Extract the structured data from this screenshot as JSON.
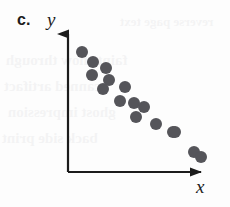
{
  "figure": {
    "part_label": "c.",
    "y_axis_label": "y",
    "x_axis_label": "x",
    "ink_color": "#1c1c1c",
    "dot_color": "#55555a",
    "background_color": "#fdfdfd"
  },
  "axes": {
    "origin": {
      "x": 68,
      "y": 172
    },
    "y_tip": {
      "x": 68,
      "y": 23
    },
    "x_tip": {
      "x": 212,
      "y": 172
    },
    "line_width": 2.2,
    "arrowhead": "solid-triangle"
  },
  "background_bleed": [
    {
      "text": "reverse page text",
      "x": 120,
      "y": 14,
      "size": 13
    },
    {
      "text": "faint show through",
      "x": 6,
      "y": 52,
      "size": 15
    },
    {
      "text": "scanned artifact",
      "x": 4,
      "y": 78,
      "size": 15
    },
    {
      "text": "ghost impression",
      "x": 8,
      "y": 104,
      "size": 15
    },
    {
      "text": "back side print",
      "x": 2,
      "y": 130,
      "size": 15
    }
  ],
  "chart_data": {
    "type": "scatter",
    "title": "c.",
    "xlabel": "x",
    "ylabel": "y",
    "grid": false,
    "legend": null,
    "axis_ticks": false,
    "xlim": [
      0,
      10
    ],
    "ylim": [
      0,
      10
    ],
    "relationship": "negative linear association",
    "series": [
      {
        "name": "observations",
        "marker": "filled-circle",
        "marker_color": "#55555a",
        "marker_size_px": 12,
        "points": [
          {
            "x": 0.55,
            "y": 8.85
          },
          {
            "x": 1.35,
            "y": 8.15
          },
          {
            "x": 1.25,
            "y": 7.25
          },
          {
            "x": 2.25,
            "y": 7.75
          },
          {
            "x": 2.45,
            "y": 6.95
          },
          {
            "x": 2.05,
            "y": 6.35
          },
          {
            "x": 3.55,
            "y": 6.45
          },
          {
            "x": 3.25,
            "y": 5.45
          },
          {
            "x": 4.25,
            "y": 5.35
          },
          {
            "x": 4.95,
            "y": 5.05
          },
          {
            "x": 4.35,
            "y": 4.35
          },
          {
            "x": 5.75,
            "y": 3.85
          },
          {
            "x": 6.95,
            "y": 3.35
          },
          {
            "x": 8.45,
            "y": 1.95
          },
          {
            "x": 8.95,
            "y": 1.55
          },
          {
            "x": 7.05,
            "y": 3.35
          }
        ]
      }
    ]
  },
  "pixel_points": [
    {
      "cx": 82,
      "cy": 52
    },
    {
      "cx": 93,
      "cy": 62
    },
    {
      "cx": 92,
      "cy": 75
    },
    {
      "cx": 106,
      "cy": 68
    },
    {
      "cx": 109,
      "cy": 80
    },
    {
      "cx": 103,
      "cy": 89
    },
    {
      "cx": 125,
      "cy": 87
    },
    {
      "cx": 120,
      "cy": 101
    },
    {
      "cx": 134,
      "cy": 103
    },
    {
      "cx": 144,
      "cy": 107
    },
    {
      "cx": 136,
      "cy": 117
    },
    {
      "cx": 156,
      "cy": 124
    },
    {
      "cx": 173,
      "cy": 132
    },
    {
      "cx": 194,
      "cy": 152
    },
    {
      "cx": 201,
      "cy": 157
    },
    {
      "cx": 175,
      "cy": 132
    }
  ]
}
